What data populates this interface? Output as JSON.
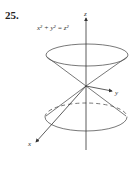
{
  "exercise": {
    "number": "25."
  },
  "figure": {
    "equation": "x² + y² = z²",
    "axis_labels": {
      "x": "x",
      "y": "y",
      "z": "z"
    }
  }
}
